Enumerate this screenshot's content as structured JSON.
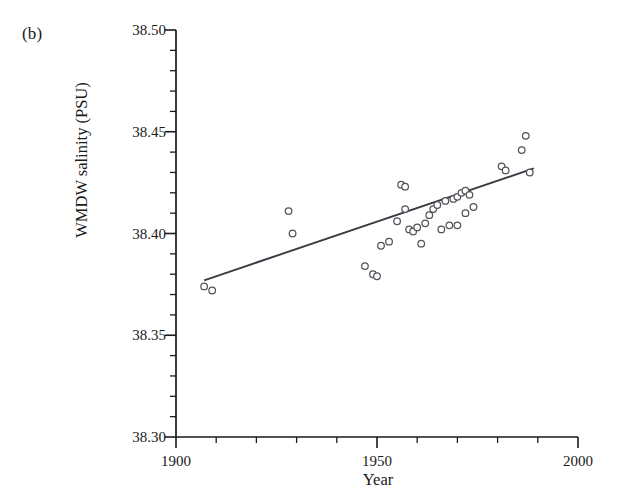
{
  "panel": {
    "label": "(b)"
  },
  "chart_data": {
    "type": "scatter",
    "title": "",
    "subtitle": "",
    "xlabel": "Year",
    "ylabel": "WMDW salinity (PSU)",
    "xlim": [
      1900,
      2000
    ],
    "ylim": [
      38.3,
      38.5
    ],
    "grid": false,
    "legend": "none",
    "x_major_ticks": [
      1900,
      1950,
      2000
    ],
    "x_major_ticklabels": [
      "1900",
      "1950",
      "2000"
    ],
    "x_minor_tick_step": 10,
    "y_major_ticks": [
      38.3,
      38.35,
      38.4,
      38.45,
      38.5
    ],
    "y_major_ticklabels": [
      "38.30",
      "38.35",
      "38.40",
      "38.45",
      "38.50"
    ],
    "y_minor_tick_step": 0.01,
    "marker_style": "open-circle",
    "series": [
      {
        "name": "WMDW salinity observations",
        "points": [
          [
            1907,
            38.374
          ],
          [
            1909,
            38.372
          ],
          [
            1928,
            38.411
          ],
          [
            1929,
            38.4
          ],
          [
            1947,
            38.384
          ],
          [
            1949,
            38.38
          ],
          [
            1950,
            38.379
          ],
          [
            1951,
            38.394
          ],
          [
            1953,
            38.396
          ],
          [
            1955,
            38.406
          ],
          [
            1956,
            38.424
          ],
          [
            1957,
            38.423
          ],
          [
            1957,
            38.412
          ],
          [
            1958,
            38.402
          ],
          [
            1959,
            38.401
          ],
          [
            1960,
            38.403
          ],
          [
            1961,
            38.395
          ],
          [
            1962,
            38.405
          ],
          [
            1963,
            38.409
          ],
          [
            1964,
            38.412
          ],
          [
            1965,
            38.414
          ],
          [
            1966,
            38.402
          ],
          [
            1967,
            38.416
          ],
          [
            1968,
            38.404
          ],
          [
            1969,
            38.417
          ],
          [
            1970,
            38.418
          ],
          [
            1970,
            38.404
          ],
          [
            1971,
            38.42
          ],
          [
            1972,
            38.421
          ],
          [
            1972,
            38.41
          ],
          [
            1973,
            38.419
          ],
          [
            1974,
            38.413
          ],
          [
            1981,
            38.433
          ],
          [
            1982,
            38.431
          ],
          [
            1986,
            38.441
          ],
          [
            1987,
            38.448
          ],
          [
            1988,
            38.43
          ]
        ]
      }
    ],
    "trendline": {
      "type": "linear-fit",
      "x_start": 1907,
      "y_start": 38.377,
      "x_end": 1989,
      "y_end": 38.432
    }
  }
}
